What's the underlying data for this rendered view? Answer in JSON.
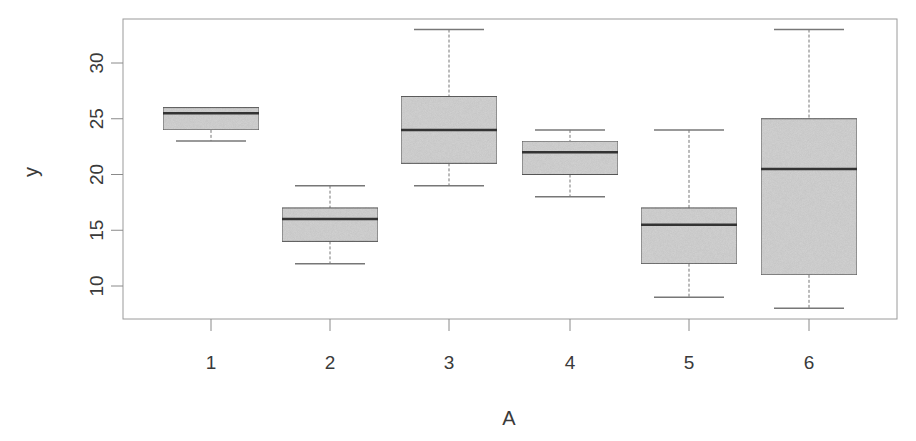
{
  "chart_data": {
    "type": "boxplot",
    "title": "",
    "xlabel": "A",
    "ylabel": "y",
    "categories": [
      "1",
      "2",
      "3",
      "4",
      "5",
      "6"
    ],
    "series": [
      {
        "name": "1",
        "min": 23,
        "q1": 24,
        "median": 25.5,
        "q3": 26,
        "max": 26
      },
      {
        "name": "2",
        "min": 12,
        "q1": 14,
        "median": 16,
        "q3": 17,
        "max": 19
      },
      {
        "name": "3",
        "min": 19,
        "q1": 21,
        "median": 24,
        "q3": 27,
        "max": 33
      },
      {
        "name": "4",
        "min": 18,
        "q1": 20,
        "median": 22,
        "q3": 23,
        "max": 24
      },
      {
        "name": "5",
        "min": 9,
        "q1": 12,
        "median": 15.5,
        "q3": 17,
        "max": 24
      },
      {
        "name": "6",
        "min": 8,
        "q1": 11,
        "median": 20.5,
        "q3": 25,
        "max": 33
      }
    ],
    "yticks": [
      10,
      15,
      20,
      25,
      30
    ],
    "ylim": [
      7,
      34
    ],
    "grid": false,
    "legend": null,
    "colors": {
      "box_fill": "#d4d4d4",
      "box_border": "#5a5a5a",
      "median": "#333333",
      "whisker": "#777777",
      "axis": "#8a8a8a"
    }
  }
}
